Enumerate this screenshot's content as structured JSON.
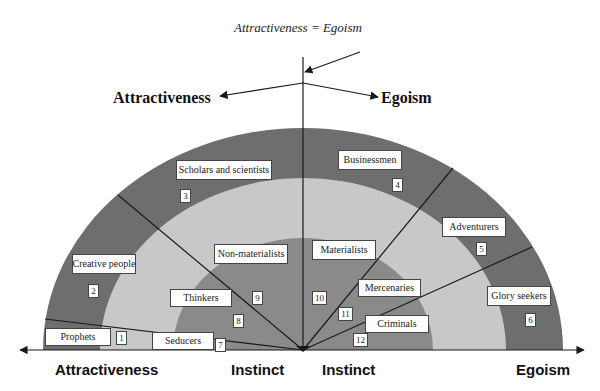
{
  "diagram": {
    "caption": "Attractiveness = Egoism",
    "top_labels": {
      "left": "Attractiveness",
      "right": "Egoism"
    },
    "axis_labels": {
      "left_end": "Attractiveness",
      "center_left": "Instinct",
      "center_right": "Instinct",
      "right_end": "Egoism"
    },
    "colors": {
      "outer_ring": "#6e6e6e",
      "middle_ring": "#c8c8c8",
      "inner_core": "#8a8a8a",
      "lines": "#1a1a1a"
    },
    "segments": [
      {
        "id": 1,
        "label": "Prophets",
        "number": "1"
      },
      {
        "id": 2,
        "label": "Creative people",
        "number": "2"
      },
      {
        "id": 3,
        "label": "Scholars and scientists",
        "number": "3"
      },
      {
        "id": 4,
        "label": "Businessmen",
        "number": "4"
      },
      {
        "id": 5,
        "label": "Adventurers",
        "number": "5"
      },
      {
        "id": 6,
        "label": "Glory seekers",
        "number": "6"
      },
      {
        "id": 7,
        "label": "Seducers",
        "number": "7"
      },
      {
        "id": 8,
        "label": "Thinkers",
        "number": "8"
      },
      {
        "id": 9,
        "label": "Non-materialists",
        "number": "9"
      },
      {
        "id": 10,
        "label": "Materialists",
        "number": "10"
      },
      {
        "id": 11,
        "label": "Mercenaries",
        "number": "11"
      },
      {
        "id": 12,
        "label": "Criminals",
        "number": "12"
      }
    ]
  }
}
